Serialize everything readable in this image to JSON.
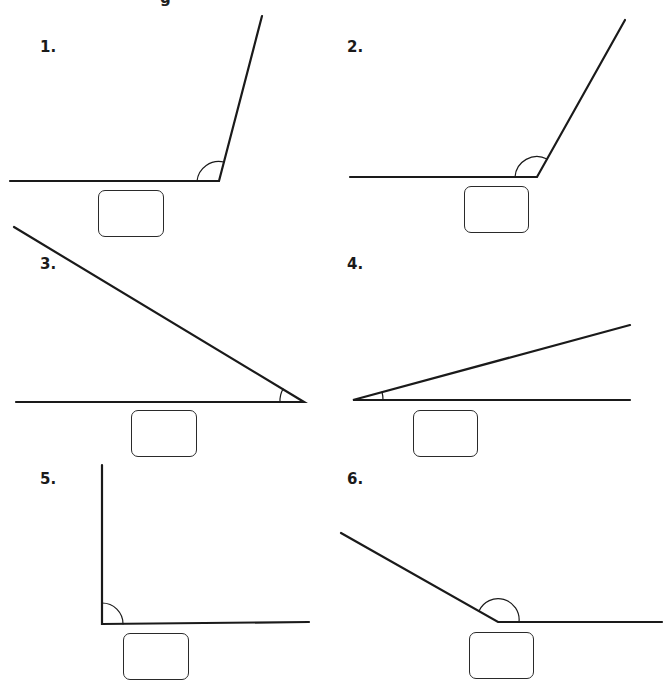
{
  "worksheet": {
    "title_fragment": "g",
    "stroke_color": "#1a1a1a",
    "problems": [
      {
        "number": "1.",
        "label_pos": [
          40,
          38
        ],
        "vertex": [
          219,
          181
        ],
        "arm_a": [
          10,
          181
        ],
        "arm_b": [
          262,
          16
        ],
        "arc": "obtuse",
        "box": [
          98,
          190,
          66,
          47
        ]
      },
      {
        "number": "2.",
        "label_pos": [
          347,
          38
        ],
        "vertex": [
          537,
          177
        ],
        "arm_a": [
          350,
          177
        ],
        "arm_b": [
          625,
          20
        ],
        "arc": "obtuse",
        "box": [
          464,
          186,
          65,
          47
        ]
      },
      {
        "number": "3.",
        "label_pos": [
          40,
          257
        ],
        "vertex": [
          304,
          402
        ],
        "arm_a": [
          16,
          402
        ],
        "arm_b": [
          14,
          227
        ],
        "arc": "acute",
        "box": [
          131,
          410,
          66,
          47
        ]
      },
      {
        "number": "4.",
        "label_pos": [
          347,
          257
        ],
        "vertex": [
          353,
          400
        ],
        "arm_a": [
          630,
          400
        ],
        "arm_b": [
          630,
          325
        ],
        "arc": "acute",
        "box": [
          413,
          410,
          65,
          47
        ]
      },
      {
        "number": "5.",
        "label_pos": [
          40,
          471
        ],
        "vertex": [
          102,
          624
        ],
        "arm_a": [
          309,
          622
        ],
        "arm_b": [
          102,
          465
        ],
        "arc": "right",
        "box": [
          123,
          633,
          66,
          47
        ]
      },
      {
        "number": "6.",
        "label_pos": [
          347,
          471
        ],
        "vertex": [
          498,
          622
        ],
        "arm_a": [
          662,
          622
        ],
        "arm_b": [
          341,
          533
        ],
        "arc": "obtuse",
        "box": [
          469,
          632,
          65,
          47
        ]
      }
    ]
  }
}
